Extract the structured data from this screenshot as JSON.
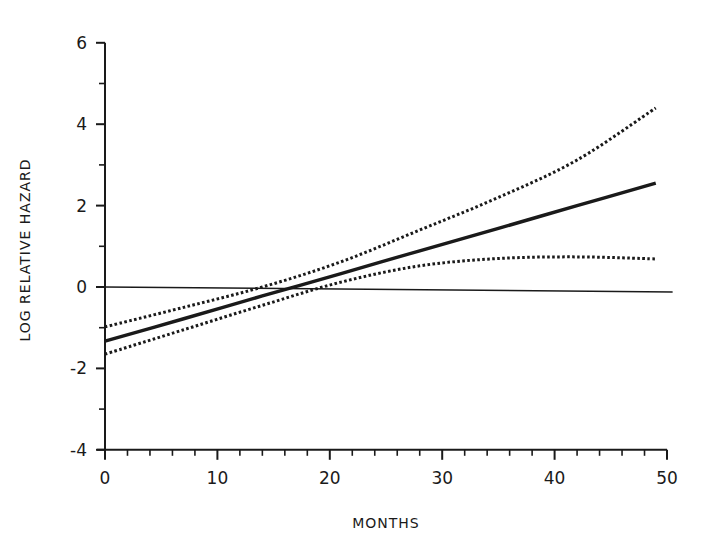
{
  "chart_data": {
    "type": "line",
    "title": "",
    "xlabel": "MONTHS",
    "ylabel": "LOG RELATIVE HAZARD",
    "xlim": [
      0,
      50
    ],
    "ylim": [
      -4,
      6
    ],
    "x_ticks": [
      0,
      10,
      20,
      30,
      40,
      50
    ],
    "x_tick_labels": [
      "0",
      "10",
      "20",
      "30",
      "40",
      "50"
    ],
    "x_minor_tick_step": 2,
    "y_ticks": [
      -4,
      -2,
      0,
      2,
      4,
      6
    ],
    "y_tick_labels": [
      "-4",
      "-2",
      "0",
      "2",
      "4",
      "6"
    ],
    "y_minor_tick_step": 1,
    "grid": false,
    "legend": null,
    "reference_line": {
      "name": "zero reference",
      "y": 0,
      "x_range": [
        0,
        50.5
      ],
      "style": "thin solid"
    },
    "x": [
      0,
      7,
      14,
      21,
      28,
      35,
      42,
      49
    ],
    "series": [
      {
        "name": "Estimate",
        "style": "solid-thick",
        "values": [
          -1.33,
          -0.78,
          -0.22,
          0.33,
          0.89,
          1.44,
          2.0,
          2.55
        ]
      },
      {
        "name": "Upper confidence bound",
        "style": "dotted",
        "values": [
          -0.98,
          -0.5,
          0.0,
          0.62,
          1.4,
          2.2,
          3.12,
          4.4
        ]
      },
      {
        "name": "Lower confidence bound",
        "style": "dotted",
        "values": [
          -1.65,
          -1.05,
          -0.45,
          0.12,
          0.52,
          0.7,
          0.74,
          0.69
        ]
      }
    ]
  },
  "colors": {
    "ink": "#1a1a1a",
    "background": "#ffffff"
  }
}
